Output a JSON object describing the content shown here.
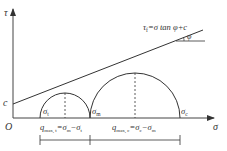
{
  "diagram": {
    "type": "mohr-coulomb",
    "axes": {
      "x_label": "σ",
      "y_label": "τ",
      "origin_label": "O"
    },
    "intercept_label": "c",
    "envelope_label": {
      "tau": "τ",
      "tau_sub": "f",
      "rest": "=σ tan φ+c"
    },
    "angle_label": "φ",
    "circles": [
      {
        "name": "small",
        "left_label": "σ",
        "left_sub": "t"
      },
      {
        "name": "large",
        "left_label": "σ",
        "left_sub": "m",
        "right_label": "σ",
        "right_sub": "c"
      }
    ],
    "annotations": [
      {
        "q": "q",
        "q_sub": "max, t",
        "expr_a": "σ",
        "expr_a_sub": "m",
        "minus": "−",
        "expr_b": "σ",
        "expr_b_sub": "t"
      },
      {
        "q": "q",
        "q_sub": "max, c",
        "expr_a": "σ",
        "expr_a_sub": "c",
        "minus": "−",
        "expr_b": "σ",
        "expr_b_sub": "m"
      }
    ],
    "colors": {
      "line": "#333333",
      "axis": "#444444"
    }
  }
}
